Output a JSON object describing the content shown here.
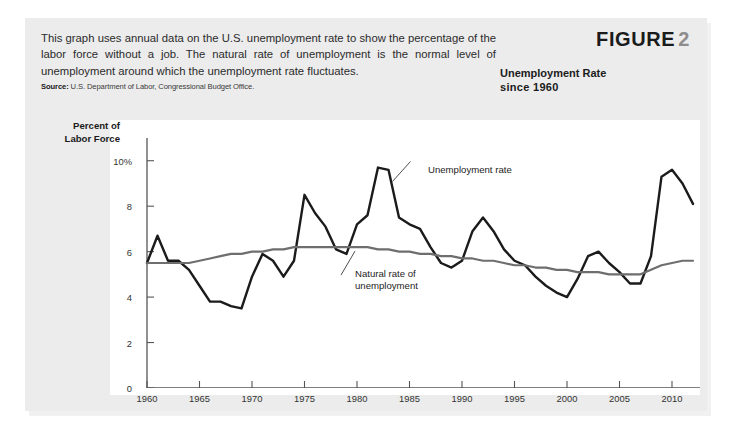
{
  "figure": {
    "caption": "This graph uses annual data on the U.S. unemployment rate to show the percentage of the labor force without a job. The natural rate of unemployment is the normal level of unemployment around which the unemployment rate fluctuates.",
    "source_label": "Source:",
    "source_text": " U.S. Department of Labor, Congressional Budget Office.",
    "figure_word": "FIGURE",
    "figure_number": "2",
    "title_line1": "Unemployment Rate",
    "title_line2": "since 1960"
  },
  "colors": {
    "panel_background": "#ececec",
    "plot_background": "#ffffff",
    "unemployment_line": "#1b1b1b",
    "natural_rate_line": "#6e6e6e",
    "axis": "#555555",
    "text": "#1b1b1b"
  },
  "chart_data": {
    "type": "line",
    "title": "Unemployment Rate since 1960",
    "xlabel": "",
    "ylabel": "Percent of Labor Force",
    "ylim": [
      0,
      11
    ],
    "xlim": [
      1960,
      2012
    ],
    "grid": false,
    "legend": "inline-annotations",
    "ytick_labels": [
      "0",
      "2",
      "4",
      "6",
      "8",
      "10%"
    ],
    "ytick_values": [
      0,
      2,
      4,
      6,
      8,
      10
    ],
    "xtick_labels": [
      "1960",
      "1965",
      "1970",
      "1975",
      "1980",
      "1985",
      "1990",
      "1995",
      "2000",
      "2005",
      "2010"
    ],
    "xtick_values": [
      1960,
      1965,
      1970,
      1975,
      1980,
      1985,
      1990,
      1995,
      2000,
      2005,
      2010
    ],
    "x": [
      1960,
      1961,
      1962,
      1963,
      1964,
      1965,
      1966,
      1967,
      1968,
      1969,
      1970,
      1971,
      1972,
      1973,
      1974,
      1975,
      1976,
      1977,
      1978,
      1979,
      1980,
      1981,
      1982,
      1983,
      1984,
      1985,
      1986,
      1987,
      1988,
      1989,
      1990,
      1991,
      1992,
      1993,
      1994,
      1995,
      1996,
      1997,
      1998,
      1999,
      2000,
      2001,
      2002,
      2003,
      2004,
      2005,
      2006,
      2007,
      2008,
      2009,
      2010,
      2011,
      2012
    ],
    "series": [
      {
        "name": "Unemployment rate",
        "color": "#1b1b1b",
        "values": [
          5.5,
          6.7,
          5.6,
          5.6,
          5.2,
          4.5,
          3.8,
          3.8,
          3.6,
          3.5,
          4.9,
          5.9,
          5.6,
          4.9,
          5.6,
          8.5,
          7.7,
          7.1,
          6.1,
          5.9,
          7.2,
          7.6,
          9.7,
          9.6,
          7.5,
          7.2,
          7.0,
          6.2,
          5.5,
          5.3,
          5.6,
          6.9,
          7.5,
          6.9,
          6.1,
          5.6,
          5.4,
          4.9,
          4.5,
          4.2,
          4.0,
          4.8,
          5.8,
          6.0,
          5.5,
          5.1,
          4.6,
          4.6,
          5.8,
          9.3,
          9.6,
          9.0,
          8.1
        ]
      },
      {
        "name": "Natural rate of unemployment",
        "color": "#6e6e6e",
        "values": [
          5.5,
          5.5,
          5.5,
          5.5,
          5.5,
          5.6,
          5.7,
          5.8,
          5.9,
          5.9,
          6.0,
          6.0,
          6.1,
          6.1,
          6.2,
          6.2,
          6.2,
          6.2,
          6.2,
          6.2,
          6.2,
          6.2,
          6.1,
          6.1,
          6.0,
          6.0,
          5.9,
          5.9,
          5.8,
          5.8,
          5.7,
          5.7,
          5.6,
          5.6,
          5.5,
          5.4,
          5.4,
          5.3,
          5.3,
          5.2,
          5.2,
          5.1,
          5.1,
          5.1,
          5.0,
          5.0,
          5.0,
          5.0,
          5.2,
          5.4,
          5.5,
          5.6,
          5.6
        ]
      }
    ],
    "annotations": [
      {
        "text": "Unemployment rate",
        "for": "Unemployment rate",
        "anchor_year": 1983,
        "anchor_value": 9.0
      },
      {
        "text": "Natural rate of\nunemployment",
        "for": "Natural rate of unemployment",
        "anchor_year": 1980,
        "anchor_value": 6.2
      }
    ]
  }
}
